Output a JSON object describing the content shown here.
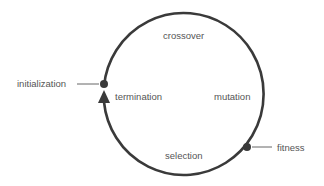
{
  "diagram": {
    "type": "cycle",
    "stroke_color": "#3a3a3a",
    "text_color": "#555555",
    "nodes": {
      "initialization": "initialization",
      "fitness": "fitness"
    },
    "stages": {
      "crossover": "crossover",
      "mutation": "mutation",
      "selection": "selection",
      "termination": "termination"
    }
  }
}
